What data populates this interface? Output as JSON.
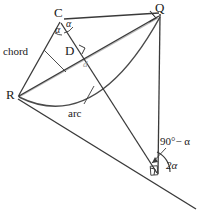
{
  "figure": {
    "background_color": "#ffffff",
    "line_color": "#3a3a3a",
    "accent_color": "#a8a8a8",
    "text_color": "#1a1a1a",
    "width": 206,
    "height": 217
  },
  "points": {
    "C": {
      "label": "C",
      "x": 60,
      "y": 18
    },
    "Q": {
      "label": "Q",
      "x": 160,
      "y": 12
    },
    "D": {
      "label": "D",
      "x": 76,
      "y": 52
    },
    "R": {
      "label": "R",
      "x": 17,
      "y": 96
    },
    "V": {
      "label": "",
      "x": 158,
      "y": 174
    }
  },
  "labels": {
    "chord": "chord",
    "arc": "arc",
    "diameter": "d",
    "alpha_left": "α",
    "alpha_right": "α",
    "two_alpha": "2α",
    "ninety_minus_alpha": "90°− α"
  },
  "markers": {
    "right_angle_at_Q": "right-angle",
    "right_angle_at_D": "right-angle",
    "right_angle_at_V": "right-angle",
    "angle_arc_two_alpha": "angle-arc",
    "angle_arc_alpha_left": "angle-arc",
    "angle_arc_alpha_right": "angle-arc"
  },
  "elements": {
    "chord_line": "chord R–Q",
    "arc_curve": "arc R–Q",
    "diameter_line": "diameter d from R to Q",
    "baseline": "baseline through R and vertex V",
    "leader_chord": "leader line from chord label",
    "leader_arc": "leader line from arc label",
    "leader_angle": "leader line from 90°−α label"
  }
}
